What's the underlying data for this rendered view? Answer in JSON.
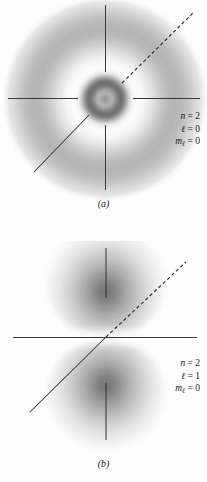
{
  "figure": {
    "background_color": "#fdfdfd",
    "axis_color": "#3a3a3a",
    "cloud_color": "#5c5c5c"
  },
  "panels": [
    {
      "id": "a",
      "caption": "(a)",
      "orbital": "2s",
      "description": "spherically symmetric probability cloud with one radial node",
      "quantum_numbers": {
        "n_symbol": "n",
        "n_equals": "=",
        "n_value": "2",
        "l_symbol": "ℓ",
        "l_equals": "=",
        "l_value": "0",
        "m_symbol": "m",
        "m_subscript": "ℓ",
        "m_equals": "=",
        "m_value": "0"
      },
      "lines": {
        "vertical_axis": "solid, broken at centre",
        "horizontal_axis": "solid, broken at centre",
        "upper_right_diagonal": "dashed",
        "lower_left_diagonal": "solid"
      }
    },
    {
      "id": "b",
      "caption": "(b)",
      "orbital": "2p",
      "description": "two-lobed dumbbell probability cloud with a nodal plane",
      "quantum_numbers": {
        "n_symbol": "n",
        "n_equals": "=",
        "n_value": "2",
        "l_symbol": "ℓ",
        "l_equals": "=",
        "l_value": "1",
        "m_symbol": "m",
        "m_subscript": "ℓ",
        "m_equals": "=",
        "m_value": "0"
      },
      "lines": {
        "vertical_axis": "solid, broken at centre",
        "horizontal_axis": "solid, continuous",
        "upper_right_diagonal": "dashed",
        "lower_left_diagonal": "solid"
      }
    }
  ]
}
